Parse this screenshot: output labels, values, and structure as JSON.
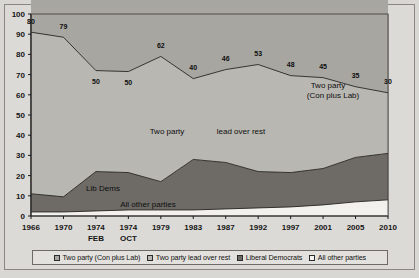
{
  "chart_data": {
    "type": "area",
    "title": "",
    "subtitle": "",
    "xlabel": "",
    "ylabel": "",
    "ylim": [
      0,
      100
    ],
    "yticks": [
      0,
      10,
      20,
      30,
      40,
      50,
      60,
      70,
      80,
      90,
      100
    ],
    "grid": true,
    "legend_position": "bottom",
    "stacked": true,
    "categories": [
      "1966",
      "1970",
      "1974 FEB",
      "1974 OCT",
      "1979",
      "1983",
      "1987",
      "1992",
      "1997",
      "2001",
      "2005",
      "2010"
    ],
    "x_tick_labels": [
      {
        "line1": "1966",
        "line2": ""
      },
      {
        "line1": "1970",
        "line2": ""
      },
      {
        "line1": "1974",
        "line2": "FEB"
      },
      {
        "line1": "1974",
        "line2": "OCT"
      },
      {
        "line1": "1979",
        "line2": ""
      },
      {
        "line1": "1983",
        "line2": ""
      },
      {
        "line1": "1987",
        "line2": ""
      },
      {
        "line1": "1992",
        "line2": ""
      },
      {
        "line1": "1997",
        "line2": ""
      },
      {
        "line1": "2001",
        "line2": ""
      },
      {
        "line1": "2005",
        "line2": ""
      },
      {
        "line1": "2010",
        "line2": ""
      }
    ],
    "series": [
      {
        "name": "All other parties",
        "color": "#f2f1ee",
        "values": [
          2,
          2,
          2.5,
          3,
          3,
          3,
          3.5,
          4,
          4.5,
          5.5,
          7,
          8
        ]
      },
      {
        "name": "Liberal Democrats",
        "color": "#6e6b67",
        "values": [
          9,
          7.5,
          19.5,
          18.5,
          14,
          25,
          23,
          18,
          17,
          18,
          22,
          23
        ]
      },
      {
        "name": "Two party lead over rest",
        "color": "#b9b7b2",
        "values": [
          80,
          79,
          50,
          50,
          62,
          40,
          46,
          53,
          48,
          45,
          35,
          30
        ]
      },
      {
        "name": "Two party (Con plus Lab)",
        "color": "#a8a6a1",
        "values": [
          90,
          90,
          74.5,
          74.5,
          77,
          80,
          76,
          81,
          70,
          70,
          71,
          72
        ]
      }
    ],
    "cumulative_top_line": [
      90,
      90,
      74.5,
      74.5,
      77,
      80,
      76,
      81,
      70,
      70,
      71,
      72
    ],
    "two_party_lead_line": [
      80,
      79,
      50,
      50,
      62,
      40,
      46,
      53,
      48,
      45,
      35,
      30
    ],
    "lib_dem_top_line": [
      9,
      7.5,
      19.5,
      18.5,
      14,
      25,
      23,
      18,
      17,
      18,
      22,
      23
    ],
    "other_parties_line": [
      2,
      2,
      2.5,
      3,
      3,
      3,
      3.5,
      4,
      4.5,
      5.5,
      7,
      8
    ],
    "data_labels": [
      {
        "text": "80",
        "x_index": 0,
        "value": 80
      },
      {
        "text": "79",
        "x_index": 1,
        "value": 79
      },
      {
        "text": "50",
        "x_index": 2,
        "value": 50
      },
      {
        "text": "50",
        "x_index": 3,
        "value": 50
      },
      {
        "text": "62",
        "x_index": 4,
        "value": 62
      },
      {
        "text": "40",
        "x_index": 5,
        "value": 40
      },
      {
        "text": "46",
        "x_index": 6,
        "value": 46
      },
      {
        "text": "53",
        "x_index": 7,
        "value": 53
      },
      {
        "text": "48",
        "x_index": 8,
        "value": 48
      },
      {
        "text": "45",
        "x_index": 9,
        "value": 45
      },
      {
        "text": "35",
        "x_index": 10,
        "value": 35
      },
      {
        "text": "30",
        "x_index": 11,
        "value": 30
      }
    ],
    "annotations": [
      {
        "name": "two-party-con-lab",
        "line1": "Two party",
        "line2": "(Con plus Lab)"
      },
      {
        "name": "two-party-lead-left",
        "text": "Two party"
      },
      {
        "name": "two-party-lead-right",
        "text": "lead over rest"
      },
      {
        "name": "lib-dems",
        "text": "Lib Dems"
      },
      {
        "name": "all-other-parties",
        "text": "All other parties"
      }
    ]
  },
  "legend": {
    "items": [
      {
        "label": "Two party (Con plus Lab)",
        "color": "#a8a6a1"
      },
      {
        "label": "Two party lead over rest",
        "color": "#b9b7b2"
      },
      {
        "label": "Liberal Democrats",
        "color": "#6e6b67"
      },
      {
        "label": "All other parties",
        "color": "#f4f3f0"
      }
    ]
  },
  "colors": {
    "page_background": "#d9d7d3",
    "plot_background": "#ffffff",
    "grid": "#4a4845",
    "axis": "#1a1a1a"
  }
}
